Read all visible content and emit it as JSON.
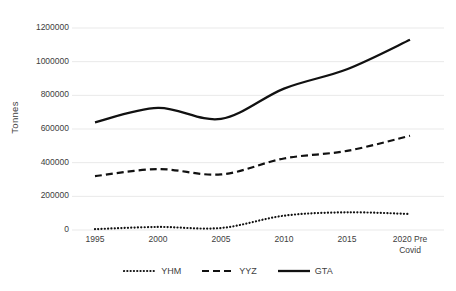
{
  "chart_data": {
    "type": "line",
    "title": "",
    "xlabel": "",
    "ylabel": "Tonnes",
    "x": [
      "1995",
      "2000",
      "2005",
      "2010",
      "2015",
      "2020 Pre Covid"
    ],
    "categories": [
      "1995",
      "2000",
      "2005",
      "2010",
      "2015",
      "2020 Pre Covid"
    ],
    "ylim": [
      0,
      1200000
    ],
    "yticks": [
      0,
      200000,
      400000,
      600000,
      800000,
      1000000,
      1200000
    ],
    "ytick_labels": [
      "0",
      "200000",
      "400000",
      "600000",
      "800000",
      "1000000",
      "1200000"
    ],
    "xtick_labels": [
      "1995",
      "2000",
      "2005",
      "2010",
      "2015",
      "2020 Pre"
    ],
    "xtick_label_last_line2": "Covid",
    "grid": true,
    "grid_axis": "y",
    "legend_position": "bottom",
    "smooth": true,
    "series": [
      {
        "name": "YHM",
        "style": "dotted",
        "color": "#111111",
        "values": [
          5000,
          18000,
          12000,
          85000,
          105000,
          95000
        ]
      },
      {
        "name": "YYZ",
        "style": "dashed",
        "color": "#111111",
        "values": [
          320000,
          362000,
          330000,
          425000,
          470000,
          560000
        ]
      },
      {
        "name": "GTA",
        "style": "solid",
        "color": "#111111",
        "values": [
          640000,
          725000,
          660000,
          840000,
          955000,
          1130000
        ]
      }
    ]
  },
  "axis": {
    "y_title": "Tonnes"
  },
  "legend": {
    "items": [
      {
        "label": "YHM",
        "style": "dotted"
      },
      {
        "label": "YYZ",
        "style": "dashed"
      },
      {
        "label": "GTA",
        "style": "solid"
      }
    ]
  }
}
